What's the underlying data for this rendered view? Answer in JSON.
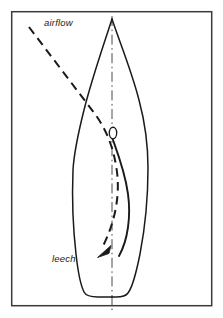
{
  "figure": {
    "name": "sail-cross-section-airflow-diagram",
    "type": "technical-line-diagram",
    "background_color": "#ffffff",
    "ink_color": "#1a1a1a",
    "frame": {
      "name": "border-frame",
      "x": 11,
      "y": 11,
      "width": 201,
      "height": 295,
      "stroke_color": "#3a3a3a",
      "stroke_width": 1.4,
      "fill": "none"
    },
    "labels": [
      {
        "id": "airflow",
        "text": "airflow",
        "x": 44,
        "y": 26,
        "style": "italic",
        "font_size": 9.5
      },
      {
        "id": "leech",
        "text": "leech",
        "x": 52,
        "y": 262,
        "style": "italic",
        "font_size": 9.5
      }
    ],
    "elements": {
      "hull_outline": {
        "name": "hull-outline",
        "description": "pointed bow at top, widest amidships, rounded transom at bottom",
        "stroke_color": "#1a1a1a",
        "stroke_width": 1.4,
        "bow_apex": [
          112,
          19
        ],
        "max_beam_left_x": 73,
        "max_beam_right_x": 148,
        "max_beam_y": 168,
        "transom_y": 296
      },
      "centerline": {
        "name": "centerline",
        "description": "dash-dot vertical axis of symmetry",
        "x": 112,
        "y_top": 16,
        "y_bottom": 311,
        "dash_pattern": "9 3 1.5 3",
        "stroke_color": "#3a3a3a",
        "stroke_width": 1.0
      },
      "mast": {
        "name": "mast-section",
        "description": "small vertical ellipse representing mast cross-section",
        "cx": 113,
        "cy": 133,
        "rx": 3.6,
        "ry": 5.6,
        "stroke_color": "#1a1a1a",
        "stroke_width": 1.3,
        "fill": "none"
      },
      "sail_curve": {
        "name": "sail-profile-curve",
        "description": "solid curved sail camber from mast down to leech",
        "stroke_color": "#1a1a1a",
        "stroke_width": 1.8,
        "start": [
          113,
          139
        ],
        "end": [
          118,
          256
        ]
      },
      "airflow_stream": {
        "name": "airflow-streamline",
        "description": "dashed incoming airflow line bending around sail and exiting at leech with arrowhead",
        "stroke_color": "#1a1a1a",
        "stroke_width": 2.0,
        "dash_pattern": "8 5",
        "start": [
          29,
          27
        ],
        "arrow_tip": [
          98,
          256
        ]
      },
      "arrowhead": {
        "name": "airflow-arrowhead",
        "description": "solid filled arrowhead at end of airflow streamline, pointing down-left",
        "tip": [
          98,
          257
        ],
        "fill_color": "#1a1a1a"
      }
    }
  }
}
